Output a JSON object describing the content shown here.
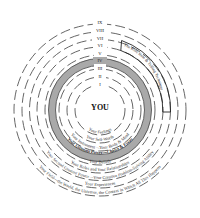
{
  "diagram": {
    "center_label": "YOU",
    "rings": [
      {
        "numeral": "I",
        "label": "Your Feelings",
        "highlighted": false
      },
      {
        "numeral": "II",
        "label": "Your Self-Worth",
        "highlighted": false
      },
      {
        "numeral": "III",
        "label": "Your Instrument—Your Body & Mind",
        "highlighted": false
      },
      {
        "numeral": "IV",
        "label": "Your Ultimate Power—Choice & Focus",
        "highlighted": true
      },
      {
        "numeral": "V",
        "label": "Your Beliefs",
        "highlighted": false
      },
      {
        "numeral": "VI",
        "label": "Your Roles and Your Relationships",
        "highlighted": false
      },
      {
        "numeral": "VII",
        "label": "Your Second Greatest Power—Your Creative Problem-Solving Ability",
        "highlighted": false
      },
      {
        "numeral": "VIII",
        "label": "Your Experiences",
        "highlighted": false
      },
      {
        "numeral": "IX",
        "label": "Your Field—the World, the Universe, the Context in Which All This Happens",
        "highlighted": false
      }
    ],
    "callout_box": {
      "label": "The Role Rule & Telling Technique"
    },
    "colors": {
      "highlight_band": "#a9a9a9",
      "ring_stroke": "#555555",
      "text": "#333333"
    }
  }
}
